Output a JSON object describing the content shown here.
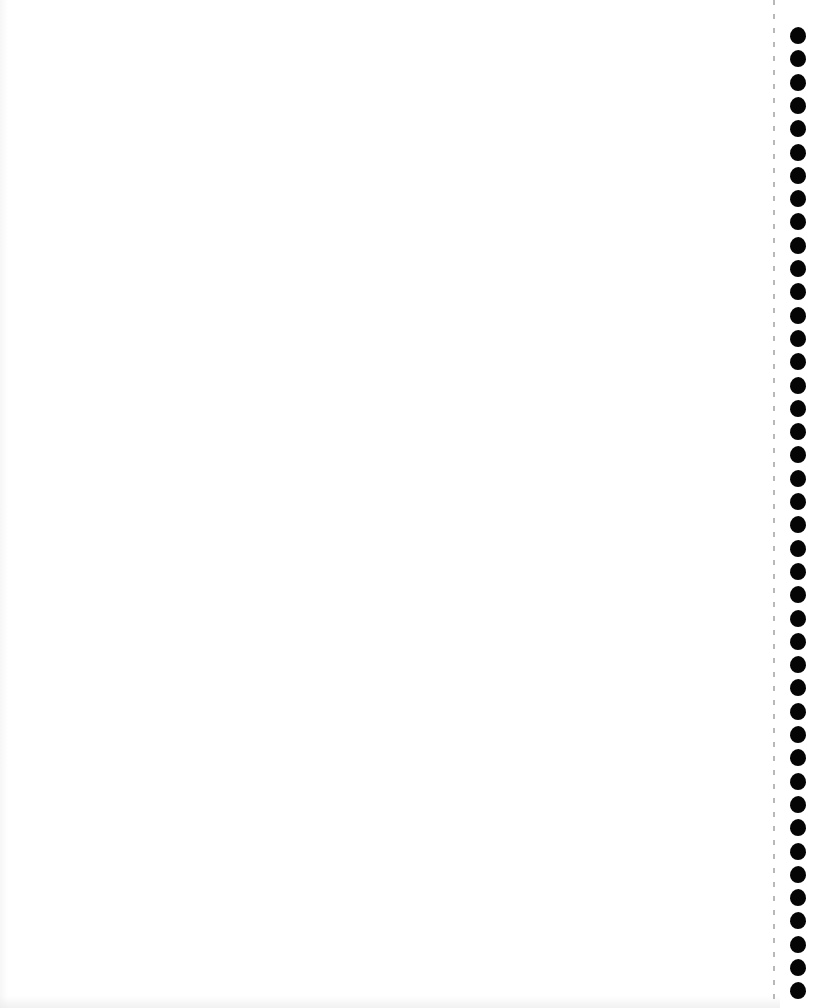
{
  "page": {
    "background_color": "#ffffff",
    "text_content": ""
  },
  "binding": {
    "side": "right",
    "hole_count": 42,
    "hole_color": "#050505",
    "first_hole_top": 27,
    "hole_pitch": 23.3,
    "perforation_line": "dashed",
    "perforation_color": "#9a9a9a"
  }
}
